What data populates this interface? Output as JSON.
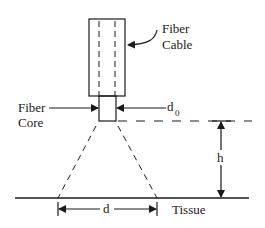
{
  "diagram": {
    "labels": {
      "fiber_cable_line1": "Fiber",
      "fiber_cable_line2": "Cable",
      "fiber_core_line1": "Fiber",
      "fiber_core_line2": "Core",
      "d0_main": "d",
      "d0_sub": "0",
      "h": "h",
      "d": "d",
      "tissue": "Tissue"
    },
    "colors": {
      "stroke": "#1a1a1a",
      "background": "#ffffff"
    }
  }
}
